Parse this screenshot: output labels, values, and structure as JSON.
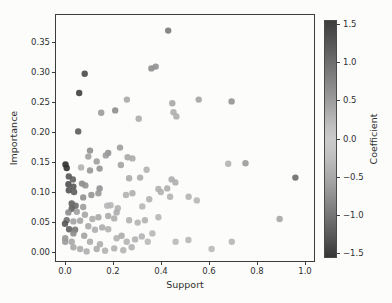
{
  "figure": {
    "width_px": 392,
    "height_px": 303,
    "background": "#fcfcfb",
    "style": "matplotlib scatter plot, grayscale print"
  },
  "colors": {
    "spine": "#3c3c3c",
    "text": "#2f2f2f",
    "background": "#fcfcfb"
  },
  "chart_data": {
    "type": "scatter",
    "title": "",
    "xlabel": "Support",
    "ylabel": "Importance",
    "xlim": [
      -0.042,
      1.042
    ],
    "ylim": [
      -0.023,
      0.397
    ],
    "grid": false,
    "xticks": [
      0.0,
      0.2,
      0.4,
      0.6,
      0.8,
      1.0
    ],
    "xtick_labels": [
      "0.0",
      "0.2",
      "0.4",
      "0.6",
      "0.8",
      "1.0"
    ],
    "yticks": [
      0.0,
      0.05,
      0.1,
      0.15,
      0.2,
      0.25,
      0.3,
      0.35
    ],
    "ytick_labels": [
      "0.00",
      "0.05",
      "0.10",
      "0.15",
      "0.20",
      "0.25",
      "0.30",
      "0.35"
    ],
    "marker": {
      "size_px": 6.4,
      "opacity": 0.9
    },
    "colorbar": {
      "label": "Coefficient",
      "orientation": "vertical",
      "position": "right",
      "vmin": -1.5,
      "vmax": 1.5,
      "ticks": [
        1.5,
        1.0,
        0.5,
        0.0,
        -0.5,
        -1.0,
        -1.5
      ],
      "tick_labels": [
        "1.5",
        "1.0",
        "0.5",
        "0.0",
        "−0.5",
        "−1.0",
        "−1.5"
      ],
      "style": "diverging, dark at both extremes, light at 0 (grayscale)",
      "gradient_stops": [
        {
          "p": 0,
          "c": "#3e3e3e"
        },
        {
          "p": 6,
          "c": "#4d4d4d"
        },
        {
          "p": 18,
          "c": "#707070"
        },
        {
          "p": 32,
          "c": "#979797"
        },
        {
          "p": 44,
          "c": "#bebebe"
        },
        {
          "p": 50,
          "c": "#cbcbcb"
        },
        {
          "p": 57,
          "c": "#c1c1c1"
        },
        {
          "p": 68,
          "c": "#a4a4a4"
        },
        {
          "p": 81,
          "c": "#7a7a7a"
        },
        {
          "p": 94,
          "c": "#4e4e4e"
        },
        {
          "p": 100,
          "c": "#363636"
        }
      ]
    },
    "points_format": [
      "x",
      "y",
      "shade"
    ],
    "n_points": 113,
    "points": [
      [
        0.43,
        0.369,
        "#7a7a7a"
      ],
      [
        0.082,
        0.297,
        "#4a4a4a"
      ],
      [
        0.36,
        0.306,
        "#8e8e8e"
      ],
      [
        0.378,
        0.309,
        "#909090"
      ],
      [
        0.059,
        0.265,
        "#3f3f3f"
      ],
      [
        0.258,
        0.254,
        "#a9a9a9"
      ],
      [
        0.447,
        0.248,
        "#a6a6a6"
      ],
      [
        0.151,
        0.232,
        "#9a9a9a"
      ],
      [
        0.209,
        0.236,
        "#8d8d8d"
      ],
      [
        0.307,
        0.222,
        "#acacac"
      ],
      [
        0.452,
        0.233,
        "#aeaeae"
      ],
      [
        0.464,
        0.226,
        "#aeaeae"
      ],
      [
        0.557,
        0.254,
        "#a3a3a3"
      ],
      [
        0.694,
        0.251,
        "#939393"
      ],
      [
        0.055,
        0.201,
        "#5b5b5b"
      ],
      [
        0.104,
        0.169,
        "#8f8f8f"
      ],
      [
        0.18,
        0.165,
        "#919191"
      ],
      [
        0.229,
        0.174,
        "#9f9f9f"
      ],
      [
        0.097,
        0.159,
        "#a1a1a1"
      ],
      [
        0.17,
        0.161,
        "#9c9c9c"
      ],
      [
        0.261,
        0.158,
        "#a9a9a9"
      ],
      [
        0.281,
        0.156,
        "#ababab"
      ],
      [
        0.132,
        0.151,
        "#9e9e9e"
      ],
      [
        0.002,
        0.146,
        "#2e2e2e"
      ],
      [
        0.007,
        0.14,
        "#313131"
      ],
      [
        0.067,
        0.141,
        "#b1b1b1"
      ],
      [
        0.104,
        0.136,
        "#979797"
      ],
      [
        0.144,
        0.139,
        "#949494"
      ],
      [
        0.233,
        0.145,
        "#a3a3a3"
      ],
      [
        0.34,
        0.137,
        "#b3b3b3"
      ],
      [
        0.68,
        0.147,
        "#b1b1b1"
      ],
      [
        0.752,
        0.148,
        "#9b9b9b"
      ],
      [
        0.96,
        0.124,
        "#6b6b6b"
      ],
      [
        0.016,
        0.126,
        "#565656"
      ],
      [
        0.033,
        0.121,
        "#5f5f5f"
      ],
      [
        0.014,
        0.113,
        "#505050"
      ],
      [
        0.035,
        0.109,
        "#595959"
      ],
      [
        0.016,
        0.103,
        "#535353"
      ],
      [
        0.038,
        0.1,
        "#5d5d5d"
      ],
      [
        0.071,
        0.114,
        "#8b8b8b"
      ],
      [
        0.085,
        0.111,
        "#929292"
      ],
      [
        0.267,
        0.123,
        "#aaaaaa"
      ],
      [
        0.313,
        0.124,
        "#acacac"
      ],
      [
        0.144,
        0.106,
        "#909090"
      ],
      [
        0.11,
        0.095,
        "#959595"
      ],
      [
        0.139,
        0.098,
        "#989898"
      ],
      [
        0.076,
        0.091,
        "#909090"
      ],
      [
        0.254,
        0.095,
        "#b1b1b1"
      ],
      [
        0.281,
        0.098,
        "#aeaeae"
      ],
      [
        0.351,
        0.088,
        "#b3b3b3"
      ],
      [
        0.399,
        0.1,
        "#b1b1b1"
      ],
      [
        0.426,
        0.106,
        "#aeaeae"
      ],
      [
        0.444,
        0.121,
        "#acacac"
      ],
      [
        0.46,
        0.116,
        "#aeaeae"
      ],
      [
        0.515,
        0.092,
        "#b3b3b3"
      ],
      [
        0.549,
        0.086,
        "#b6b6b6"
      ],
      [
        0.389,
        0.105,
        "#b1b1b1"
      ],
      [
        0.028,
        0.081,
        "#606060"
      ],
      [
        0.044,
        0.077,
        "#6b6b6b"
      ],
      [
        0.028,
        0.072,
        "#616161"
      ],
      [
        0.076,
        0.075,
        "#9c9c9c"
      ],
      [
        0.176,
        0.077,
        "#b6b6b6"
      ],
      [
        0.19,
        0.078,
        "#b6b6b6"
      ],
      [
        0.22,
        0.073,
        "#b1b1b1"
      ],
      [
        0.322,
        0.076,
        "#b6b6b6"
      ],
      [
        0.438,
        0.092,
        "#b3b3b3"
      ],
      [
        0.014,
        0.066,
        "#8b8b8b"
      ],
      [
        0.049,
        0.067,
        "#9f9f9f"
      ],
      [
        0.083,
        0.062,
        "#a6a6a6"
      ],
      [
        0.007,
        0.053,
        "#6f6f6f"
      ],
      [
        0.0,
        0.047,
        "#575757"
      ],
      [
        0.035,
        0.051,
        "#a1a1a1"
      ],
      [
        0.063,
        0.052,
        "#a4a4a4"
      ],
      [
        0.114,
        0.055,
        "#acacac"
      ],
      [
        0.139,
        0.058,
        "#a9a9a9"
      ],
      [
        0.18,
        0.06,
        "#acacac"
      ],
      [
        0.205,
        0.056,
        "#aeaeae"
      ],
      [
        0.215,
        0.066,
        "#acacac"
      ],
      [
        0.267,
        0.053,
        "#b1b1b1"
      ],
      [
        0.303,
        0.049,
        "#b3b3b3"
      ],
      [
        0.333,
        0.053,
        "#b1b1b1"
      ],
      [
        0.389,
        0.058,
        "#b6b6b6"
      ],
      [
        0.894,
        0.055,
        "#a6a6a6"
      ],
      [
        0.097,
        0.043,
        "#a9a9a9"
      ],
      [
        0.155,
        0.041,
        "#acacac"
      ],
      [
        0.125,
        0.037,
        "#aeaeae"
      ],
      [
        0.18,
        0.038,
        "#b1b1b1"
      ],
      [
        0.042,
        0.037,
        "#757575"
      ],
      [
        0.017,
        0.038,
        "#5f5f5f"
      ],
      [
        0.035,
        0.031,
        "#8b8b8b"
      ],
      [
        0.08,
        0.027,
        "#a3a3a3"
      ],
      [
        0.001,
        0.023,
        "#979797"
      ],
      [
        0.001,
        0.017,
        "#9a9a9a"
      ],
      [
        0.028,
        0.017,
        "#a6a6a6"
      ],
      [
        0.104,
        0.017,
        "#acacac"
      ],
      [
        0.146,
        0.013,
        "#aeaeae"
      ],
      [
        0.215,
        0.023,
        "#b1b1b1"
      ],
      [
        0.236,
        0.027,
        "#acacac"
      ],
      [
        0.257,
        0.017,
        "#b3b3b3"
      ],
      [
        0.292,
        0.021,
        "#b1b1b1"
      ],
      [
        0.32,
        0.026,
        "#b3b3b3"
      ],
      [
        0.364,
        0.031,
        "#b6b6b6"
      ],
      [
        0.345,
        0.017,
        "#b9b9b9"
      ],
      [
        0.461,
        0.017,
        "#b9b9b9"
      ],
      [
        0.514,
        0.02,
        "#b6b6b6"
      ],
      [
        0.611,
        0.005,
        "#b9b9b9"
      ],
      [
        0.695,
        0.017,
        "#b6b6b6"
      ],
      [
        0.035,
        0.008,
        "#a9a9a9"
      ],
      [
        0.063,
        0.005,
        "#acacac"
      ],
      [
        0.09,
        0.001,
        "#aeaeae"
      ],
      [
        0.132,
        0.005,
        "#acacac"
      ],
      [
        0.167,
        0.002,
        "#b1b1b1"
      ],
      [
        0.205,
        0.006,
        "#b1b1b1"
      ],
      [
        0.243,
        0.003,
        "#b3b3b3"
      ],
      [
        0.278,
        0.008,
        "#b1b1b1"
      ]
    ]
  }
}
